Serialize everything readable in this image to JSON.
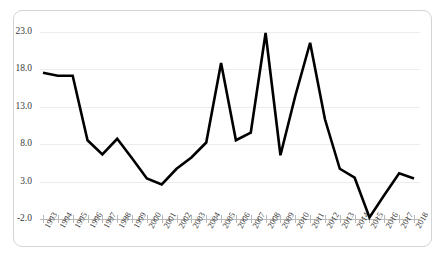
{
  "chart_data": {
    "type": "line",
    "title": "",
    "subtitle": "",
    "xlabel": "",
    "ylabel": "",
    "x": [
      1993,
      1994,
      1995,
      1996,
      1997,
      1998,
      1999,
      2000,
      2001,
      2002,
      2003,
      2004,
      2005,
      2006,
      2007,
      2008,
      2009,
      2010,
      2011,
      2012,
      2013,
      2014,
      2015,
      2016,
      2017,
      2018
    ],
    "categories": [
      "1993",
      "1994",
      "1995",
      "1996",
      "1997",
      "1998",
      "1999",
      "2000",
      "2001",
      "2002",
      "2003",
      "2004",
      "2005",
      "2006",
      "2007",
      "2008",
      "2009",
      "2010",
      "2011",
      "2012",
      "2013",
      "2014",
      "2015",
      "2016",
      "2017",
      "2018"
    ],
    "values": [
      17.5,
      17.1,
      17.1,
      8.5,
      6.6,
      8.7,
      6.1,
      3.4,
      2.6,
      4.7,
      6.2,
      8.2,
      18.8,
      8.5,
      9.5,
      22.8,
      6.5,
      14.4,
      21.5,
      11.3,
      4.7,
      3.5,
      -1.8,
      1.2,
      4.1,
      3.4
    ],
    "ylim": [
      -2.0,
      23.0
    ],
    "yticks": [
      -2.0,
      3.0,
      8.0,
      13.0,
      18.0,
      23.0
    ],
    "ytick_labels": [
      "-2.0",
      "3.0",
      "8.0",
      "13.0",
      "18.0",
      "23.0"
    ],
    "xtick_labels": [
      "1993",
      "1994",
      "1995",
      "1996",
      "1997",
      "1998",
      "1999",
      "2000",
      "2001",
      "2002",
      "2003",
      "2004",
      "2005",
      "2006",
      "2007",
      "2008",
      "2009",
      "2010",
      "2011",
      "2012",
      "2013",
      "2014",
      "2015",
      "2016",
      "2017",
      "2018"
    ],
    "grid": true,
    "legend": false,
    "legend_position": "none",
    "series": [
      {
        "name": "series-1",
        "color": "#000000",
        "values": [
          17.5,
          17.1,
          17.1,
          8.5,
          6.6,
          8.7,
          6.1,
          3.4,
          2.6,
          4.7,
          6.2,
          8.2,
          18.8,
          8.5,
          9.5,
          22.8,
          6.5,
          14.4,
          21.5,
          11.3,
          4.7,
          3.5,
          -1.8,
          1.2,
          4.1,
          3.4
        ]
      }
    ],
    "annotations": []
  },
  "style": {
    "line_color": "#000000",
    "grid_color": "#ececec",
    "axis_color": "#b9b9b9",
    "border_color": "#d4d4d4",
    "text_color": "#3b3b3b",
    "background": "#ffffff"
  }
}
